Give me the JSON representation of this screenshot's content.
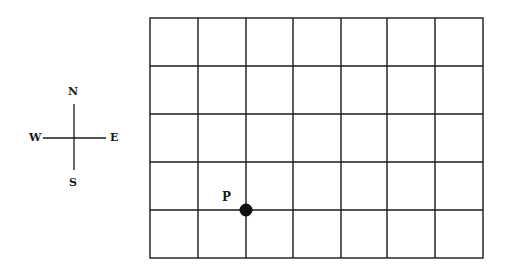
{
  "compass": {
    "north": "N",
    "south": "S",
    "east": "E",
    "west": "W"
  },
  "grid": {
    "columns": 7,
    "rows": 5,
    "line_color": "#1a1a1a"
  },
  "point": {
    "label": "P",
    "column_line": 2,
    "row_line": 4,
    "color": "#111111"
  }
}
